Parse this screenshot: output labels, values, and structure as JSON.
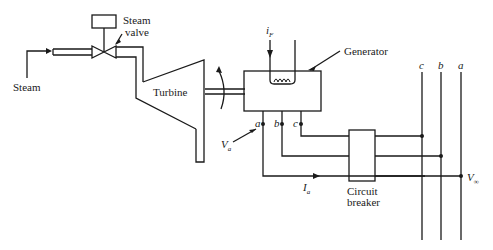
{
  "labels": {
    "steam": "Steam",
    "steam_valve_line1": "Steam",
    "steam_valve_line2": "valve",
    "turbine": "Turbine",
    "generator": "Generator",
    "field_current": "i",
    "field_current_sub": "F",
    "terminal_a": "a",
    "terminal_b": "b",
    "terminal_c": "c",
    "voltage_a": "V",
    "voltage_a_sub": "a",
    "current_a": "I",
    "current_a_sub": "a",
    "circuit_breaker_line1": "Circuit",
    "circuit_breaker_line2": "breaker",
    "bus_c": "c",
    "bus_b": "b",
    "bus_a": "a",
    "infinite_bus_voltage": "V",
    "infinite_bus_voltage_sub": "∞"
  },
  "colors": {
    "line": "#1a1a1a",
    "background": "#ffffff"
  }
}
